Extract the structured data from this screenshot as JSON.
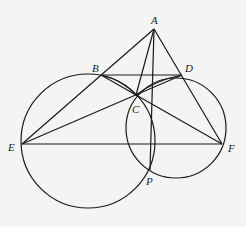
{
  "diagram": {
    "points": {
      "A": {
        "label": "A",
        "x": 154,
        "y": 29
      },
      "B": {
        "label": "B",
        "x": 101,
        "y": 75
      },
      "C": {
        "label": "C",
        "x": 136,
        "y": 95
      },
      "D": {
        "label": "D",
        "x": 182,
        "y": 75
      },
      "E": {
        "label": "E",
        "x": 22,
        "y": 144
      },
      "F": {
        "label": "F",
        "x": 222,
        "y": 144
      },
      "P": {
        "label": "P",
        "x": 148,
        "y": 170
      }
    },
    "circles": [
      {
        "name": "circle-BEP",
        "cx": 88,
        "cy": 141,
        "r": 67
      },
      {
        "name": "circle-DFP",
        "cx": 176,
        "cy": 128,
        "r": 50
      }
    ],
    "segments": [
      [
        "A",
        "E"
      ],
      [
        "A",
        "F"
      ],
      [
        "B",
        "D"
      ],
      [
        "E",
        "F"
      ],
      [
        "E",
        "D"
      ],
      [
        "F",
        "B"
      ],
      [
        "A",
        "P"
      ],
      [
        "A",
        "C"
      ],
      [
        "B",
        "C"
      ],
      [
        "D",
        "C"
      ]
    ],
    "stroke_color": "#1a1a1a"
  }
}
